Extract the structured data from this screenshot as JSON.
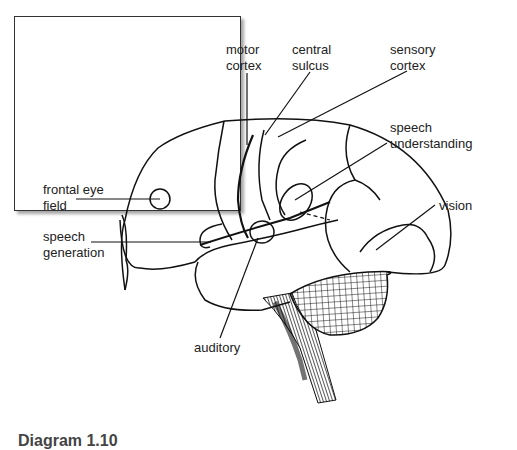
{
  "diagram": {
    "labels": {
      "motor_cortex": "motor\ncortex",
      "central_sulcus": "central\nsulcus",
      "sensory_cortex": "sensory\ncortex",
      "speech_understanding": "speech\nunderstanding",
      "frontal_eye_field": "frontal eye\nfield",
      "speech_generation": "speech\ngeneration",
      "vision": "vision",
      "auditory": "auditory"
    },
    "caption": "Diagram 1.10",
    "colors": {
      "line": "#111111",
      "frame": "#333333",
      "text": "#222222",
      "background": "#ffffff"
    }
  }
}
